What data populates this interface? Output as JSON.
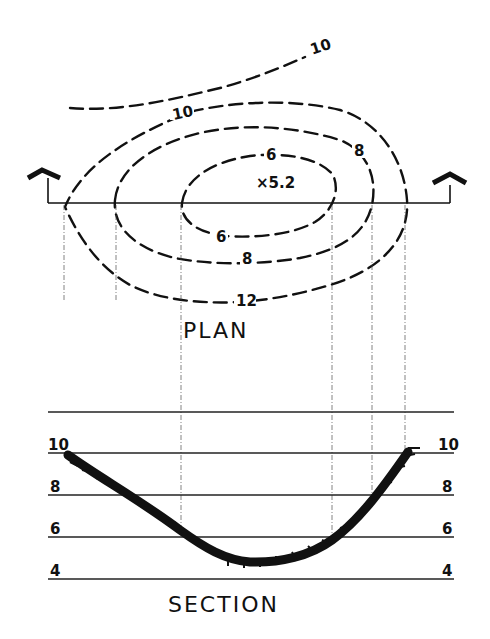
{
  "plan": {
    "title": "PLAN",
    "spot_elevation": "×5.2",
    "contour_labels": {
      "outer_top": "10",
      "ring_10": "10",
      "ring_8_upper": "8",
      "ring_6_upper": "6",
      "ring_6_lower": "6",
      "ring_8_lower": "8",
      "ring_12": "12"
    },
    "section_cut_markers": [
      "left-arrow",
      "right-arrow"
    ]
  },
  "section": {
    "title": "SECTION",
    "elevation_labels_left": [
      "10",
      "8",
      "6",
      "4"
    ],
    "elevation_labels_right": [
      "10",
      "8",
      "6",
      "4"
    ]
  },
  "colors": {
    "ink": "#111111",
    "paper": "#ffffff"
  }
}
